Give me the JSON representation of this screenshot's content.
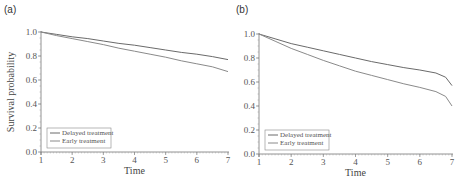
{
  "chart_data": [
    {
      "panel": "(a)",
      "type": "line",
      "title": "",
      "xlabel": "Time",
      "ylabel": "Survival probability",
      "xlim": [
        1,
        7
      ],
      "ylim": [
        0.0,
        1.0
      ],
      "xticks": [
        "1",
        "2",
        "3",
        "4",
        "5",
        "6",
        "7"
      ],
      "yticks": [
        "0.0",
        "0.2",
        "0.4",
        "0.6",
        "0.8",
        "1.0"
      ],
      "grid": false,
      "legend_position": "lower left",
      "x": [
        1,
        1.5,
        2,
        2.5,
        3,
        3.5,
        4,
        4.5,
        5,
        5.5,
        6,
        6.5,
        7
      ],
      "series": [
        {
          "name": "Delayed treatment",
          "color": "#6a6a6a",
          "values": [
            1.0,
            0.98,
            0.96,
            0.945,
            0.925,
            0.905,
            0.89,
            0.87,
            0.85,
            0.83,
            0.815,
            0.795,
            0.77
          ]
        },
        {
          "name": "Early treatment",
          "color": "#8a8a8a",
          "values": [
            1.0,
            0.97,
            0.945,
            0.92,
            0.895,
            0.865,
            0.84,
            0.815,
            0.79,
            0.76,
            0.735,
            0.71,
            0.67
          ]
        }
      ]
    },
    {
      "panel": "(b)",
      "type": "line",
      "title": "",
      "xlabel": "Time",
      "ylabel": "",
      "xlim": [
        1,
        7
      ],
      "ylim": [
        0.0,
        1.0
      ],
      "xticks": [
        "1",
        "2",
        "3",
        "4",
        "5",
        "6",
        "7"
      ],
      "yticks": [
        "0.0",
        "0.2",
        "0.4",
        "0.6",
        "0.8",
        "1.0"
      ],
      "grid": false,
      "legend_position": "lower left",
      "x": [
        1,
        1.5,
        2,
        2.5,
        3,
        3.5,
        4,
        4.5,
        5,
        5.5,
        6,
        6.5,
        6.8,
        7
      ],
      "series": [
        {
          "name": "Delayed treatment",
          "color": "#6a6a6a",
          "values": [
            1.0,
            0.96,
            0.92,
            0.89,
            0.86,
            0.83,
            0.8,
            0.77,
            0.745,
            0.72,
            0.7,
            0.675,
            0.64,
            0.57
          ]
        },
        {
          "name": "Early treatment",
          "color": "#8a8a8a",
          "values": [
            1.0,
            0.94,
            0.88,
            0.83,
            0.78,
            0.735,
            0.69,
            0.655,
            0.62,
            0.585,
            0.555,
            0.52,
            0.48,
            0.4
          ]
        }
      ]
    }
  ]
}
